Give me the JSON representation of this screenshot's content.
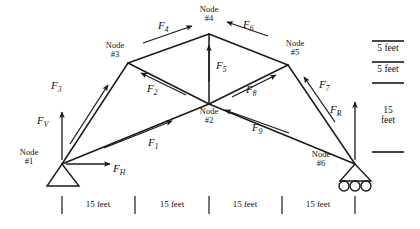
{
  "diagram": {
    "line_color": "#1a1a1a",
    "text_color": "#111111"
  },
  "nodes": [
    {
      "id": "node-1",
      "line1": "Node",
      "line2": "#1",
      "x": 62,
      "y": 164,
      "support": "pin"
    },
    {
      "id": "node-2",
      "line1": "Node",
      "line2": "#2",
      "x": 209,
      "y": 104,
      "support": "none"
    },
    {
      "id": "node-3",
      "line1": "Node",
      "line2": "#3",
      "x": 128,
      "y": 63,
      "support": "none"
    },
    {
      "id": "node-4",
      "line1": "Node",
      "line2": "#4",
      "x": 209,
      "y": 34,
      "support": "none"
    },
    {
      "id": "node-5",
      "line1": "Node",
      "line2": "#5",
      "x": 288,
      "y": 65,
      "support": "none"
    },
    {
      "id": "node-6",
      "line1": "Node",
      "line2": "#6",
      "x": 355,
      "y": 164,
      "support": "roller"
    }
  ],
  "members": [
    {
      "name": "member-1-2",
      "from": "node-1",
      "to": "node-2"
    },
    {
      "name": "member-1-3",
      "from": "node-1",
      "to": "node-3"
    },
    {
      "name": "member-3-2",
      "from": "node-3",
      "to": "node-2"
    },
    {
      "name": "member-3-4",
      "from": "node-3",
      "to": "node-4"
    },
    {
      "name": "member-4-2",
      "from": "node-4",
      "to": "node-2"
    },
    {
      "name": "member-4-5",
      "from": "node-4",
      "to": "node-5"
    },
    {
      "name": "member-5-2",
      "from": "node-5",
      "to": "node-2"
    },
    {
      "name": "member-5-6",
      "from": "node-5",
      "to": "node-6"
    },
    {
      "name": "member-2-6",
      "from": "node-2",
      "to": "node-6"
    }
  ],
  "forces": [
    {
      "id": "force-1",
      "symbol": "F",
      "sub": "1",
      "lx": 148,
      "ly": 137
    },
    {
      "id": "force-2",
      "symbol": "F",
      "sub": "2",
      "lx": 147,
      "ly": 83
    },
    {
      "id": "force-3",
      "symbol": "F",
      "sub": "3",
      "lx": 51,
      "ly": 80
    },
    {
      "id": "force-4",
      "symbol": "F",
      "sub": "4",
      "lx": 158,
      "ly": 20
    },
    {
      "id": "force-5",
      "symbol": "F",
      "sub": "5",
      "lx": 216,
      "ly": 60
    },
    {
      "id": "force-6",
      "symbol": "F",
      "sub": "6",
      "lx": 243,
      "ly": 19
    },
    {
      "id": "force-7",
      "symbol": "F",
      "sub": "7",
      "lx": 319,
      "ly": 79
    },
    {
      "id": "force-8",
      "symbol": "F",
      "sub": "8",
      "lx": 246,
      "ly": 84
    },
    {
      "id": "force-9",
      "symbol": "F",
      "sub": "9",
      "lx": 252,
      "ly": 122
    }
  ],
  "reactions": [
    {
      "id": "reaction-fv",
      "symbol": "F",
      "sub": "V",
      "lx": 37,
      "ly": 115,
      "desc": "vertical reaction at node 1"
    },
    {
      "id": "reaction-fh",
      "symbol": "F",
      "sub": "H",
      "lx": 113,
      "ly": 163,
      "desc": "horizontal reaction at node 1"
    },
    {
      "id": "reaction-fr",
      "symbol": "F",
      "sub": "R",
      "lx": 330,
      "ly": 104,
      "desc": "vertical reaction at node 6"
    }
  ],
  "bottom_dimensions": {
    "segments": [
      "15 feet",
      "15 feet",
      "15 feet",
      "15 feet"
    ],
    "tick_positions": [
      62,
      135,
      209,
      282,
      355
    ],
    "tick_top": 196,
    "tick_bottom": 214,
    "label_y": 200
  },
  "right_scale": {
    "entries": [
      {
        "label": "5 feet",
        "single_line": true
      },
      {
        "label": "5 feet",
        "single_line": true
      },
      {
        "label": "15\nfeet",
        "line1": "15",
        "line2": "feet",
        "single_line": false
      }
    ],
    "rule_x1": 372,
    "rule_x2": 404
  }
}
